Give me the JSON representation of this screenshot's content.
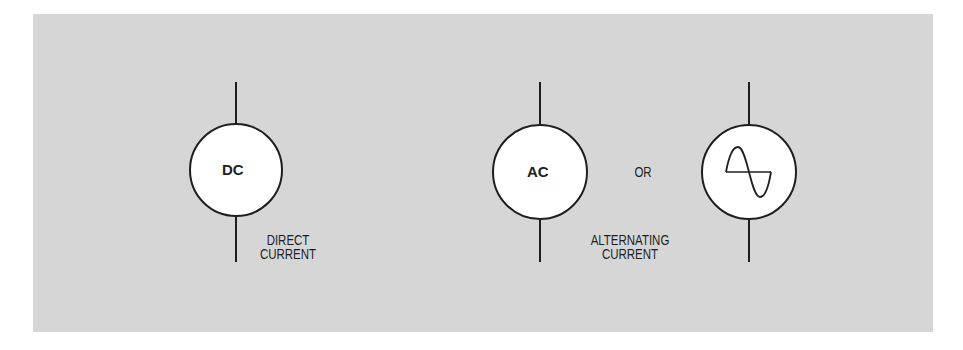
{
  "symbols": [
    {
      "id": "dc",
      "text": "DC",
      "caption_lines": [
        "DIRECT",
        "CURRENT"
      ]
    },
    {
      "id": "ac",
      "text": "AC",
      "caption_lines": [
        "ALTERNATING",
        "CURRENT"
      ]
    },
    {
      "id": "ac-sine",
      "text": "",
      "icon": "sine-wave-icon"
    }
  ],
  "separator": "OR",
  "colors": {
    "panel": "#d6d6d6",
    "circle_fill": "#ffffff",
    "stroke": "#1e1e1e"
  }
}
